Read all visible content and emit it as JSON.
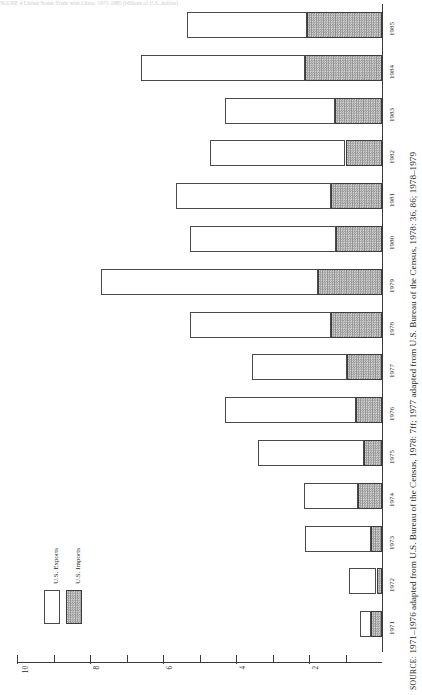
{
  "figure": {
    "title": "FIGURE 4   United States Trade with China, 1971-1985 (billions of U.S. dollars)",
    "source_prefix": "SOURCE:",
    "source_text": "1971–1976 adapted from U.S. Bureau of the Census, 1978: 7ff; 1977 adapted from U.S. Bureau of the Census, 1978: 36, 86; 1978–1979"
  },
  "legend": {
    "position": "bottom-left",
    "items": [
      {
        "label": "U.S. Exports",
        "swatch": "white-open",
        "color": "#ffffff"
      },
      {
        "label": "U.S. Imports",
        "swatch": "gray-hatched",
        "color": "#9a9a9a"
      }
    ]
  },
  "axis": {
    "tick_labels": [
      "10",
      "8",
      "6",
      "4",
      "2"
    ],
    "tick_values": [
      10,
      8,
      6,
      4,
      2
    ],
    "minor_ticks": [
      9,
      7,
      5,
      3,
      1
    ],
    "max": 10,
    "min": 0
  },
  "chart_data": {
    "type": "bar",
    "orientation": "horizontal-stacked",
    "title": "United States Trade with China, 1971-1985 (billions of U.S. dollars)",
    "xlabel": "Billions of U.S. dollars",
    "ylabel": "",
    "xlim": [
      0,
      10
    ],
    "grid": false,
    "legend_position": "bottom-left",
    "categories": [
      "1971",
      "1972",
      "1973",
      "1974",
      "1975",
      "1976",
      "1977",
      "1978",
      "1979",
      "1980",
      "1981",
      "1982",
      "1983",
      "1984",
      "1985"
    ],
    "series": [
      {
        "name": "U.S. Exports",
        "values": [
          0.3,
          0.75,
          1.8,
          1.5,
          2.9,
          3.6,
          2.6,
          3.85,
          5.95,
          4.0,
          4.25,
          3.7,
          3.0,
          4.5,
          3.3
        ]
      },
      {
        "name": "U.S. Imports",
        "values": [
          0.3,
          0.15,
          0.3,
          0.65,
          0.5,
          0.7,
          0.95,
          1.4,
          1.75,
          1.25,
          1.4,
          1.0,
          1.3,
          2.1,
          2.05
        ]
      }
    ],
    "totals": [
      0.6,
      0.9,
      2.1,
      2.15,
      3.4,
      4.3,
      3.55,
      5.25,
      7.7,
      5.25,
      5.65,
      4.7,
      4.3,
      6.6,
      5.35
    ]
  },
  "colors": {
    "exports_fill": "#ffffff",
    "imports_fill": "#9a9a9a",
    "stroke": "#4a4a4a",
    "axis": "#3a3a3a"
  }
}
